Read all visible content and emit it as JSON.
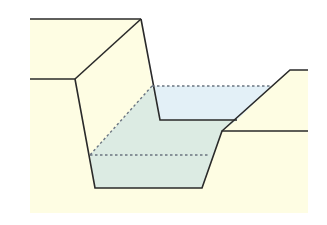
{
  "diagram": {
    "title": "",
    "colors": {
      "background": "#ffffff",
      "ground": "#fefde3",
      "water_surface_region": "#e3f0f7",
      "water_volume_region": "#dcebe3",
      "outline": "#2a2a2a",
      "dashed": "#6a7480"
    },
    "labels": []
  }
}
